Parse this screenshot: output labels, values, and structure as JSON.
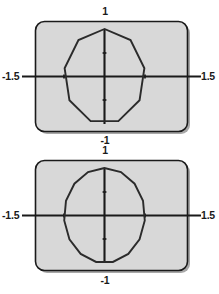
{
  "figure": {
    "background_color": "#ffffff",
    "panel_fill_color": "#d8d8d8",
    "panel_border_color": "#1a1a1a",
    "axis_color": "#1a1a1a",
    "curve_color": "#2b2b2b"
  },
  "plots": [
    {
      "name": "upper-plot",
      "labels": {
        "top": "1",
        "bottom": "-1",
        "left": "-1.5",
        "right": "1.5"
      }
    },
    {
      "name": "lower-plot",
      "labels": {
        "top": "1",
        "bottom": "-1",
        "left": "-1.5",
        "right": "1.5"
      }
    }
  ],
  "chart_data": [
    {
      "type": "line",
      "name": "upper-plot",
      "title": "",
      "xlabel": "",
      "ylabel": "",
      "xlim": [
        -1.5,
        1.5
      ],
      "ylim": [
        -1.0,
        1.0
      ],
      "xticks": [
        -1.5,
        -0.5,
        0.5,
        1.5
      ],
      "yticks": [
        -1.0,
        -0.5,
        0.5,
        1.0
      ],
      "xtick_labels": [
        "-1.5",
        "",
        "",
        "1.5"
      ],
      "ytick_labels": [
        "-1",
        "",
        "",
        "1"
      ],
      "grid": false,
      "legend": "none",
      "closed": true,
      "n_sides": 9,
      "description": "Closed nonagonal polygon approximating the unit circle, one vertex at the top on the vertical axis",
      "x": [
        0.0,
        0.643,
        0.985,
        0.866,
        0.342,
        -0.342,
        -0.866,
        -0.985,
        -0.643,
        0.0
      ],
      "y": [
        1.0,
        0.766,
        0.174,
        -0.5,
        -0.94,
        -0.94,
        -0.5,
        0.174,
        0.766,
        1.0
      ]
    },
    {
      "type": "line",
      "name": "lower-plot",
      "title": "",
      "xlabel": "",
      "ylabel": "",
      "xlim": [
        -1.5,
        1.5
      ],
      "ylim": [
        -1.0,
        1.0
      ],
      "xticks": [
        -1.5,
        -0.5,
        0.5,
        1.5
      ],
      "yticks": [
        -1.0,
        -0.5,
        0.5,
        1.0
      ],
      "xtick_labels": [
        "-1.5",
        "",
        "",
        "1.5"
      ],
      "ytick_labels": [
        "-1",
        "",
        "",
        "1"
      ],
      "grid": false,
      "legend": "none",
      "closed": true,
      "n_sides": 15,
      "description": "Closed 15-sided polygon approximating the unit circle, one vertex at the top on the vertical axis",
      "x": [
        0.0,
        0.407,
        0.743,
        0.951,
        0.995,
        0.866,
        0.588,
        0.208,
        -0.208,
        -0.588,
        -0.866,
        -0.995,
        -0.951,
        -0.743,
        -0.407,
        0.0
      ],
      "y": [
        1.0,
        0.914,
        0.669,
        0.309,
        -0.105,
        -0.5,
        -0.809,
        -0.978,
        -0.978,
        -0.809,
        -0.5,
        -0.105,
        0.309,
        0.669,
        0.914,
        1.0
      ]
    }
  ]
}
